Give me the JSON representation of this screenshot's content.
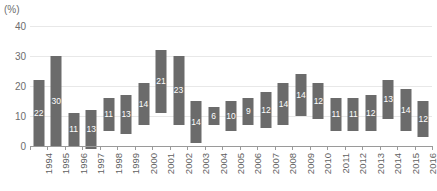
{
  "chart_data": {
    "type": "bar",
    "title": "",
    "subtitle": "",
    "xlabel": "",
    "ylabel": "(%)",
    "unit_label": "(%)",
    "ylim": [
      0,
      40
    ],
    "yticks": [
      0,
      10,
      20,
      30,
      40
    ],
    "ytick_labels": [
      "0",
      "10",
      "20",
      "30",
      "40"
    ],
    "grid": true,
    "legend": "none",
    "orientation": "vertical",
    "bar_style": "floating-range",
    "bar_color": "#6b6b6b",
    "gridline_color": "#e8e8e8",
    "axis_color": "#9a9a9a",
    "label_color": "#5f5f5f",
    "value_label_color": "#ffffff",
    "categories": [
      "1994",
      "1995",
      "1996",
      "1997",
      "1998",
      "1999",
      "2000",
      "2001",
      "2002",
      "2003",
      "2004",
      "2005",
      "2006",
      "2007",
      "2008",
      "2009",
      "2010",
      "2011",
      "2012",
      "2013",
      "2014",
      "2015",
      "2016"
    ],
    "values": [
      22,
      30,
      11,
      13,
      11,
      13,
      14,
      21,
      23,
      14,
      6,
      10,
      9,
      12,
      14,
      14,
      12,
      11,
      11,
      12,
      13,
      14,
      12
    ],
    "bar_ranges": [
      {
        "year": "1994",
        "value": 22,
        "bottom": 0,
        "top": 22
      },
      {
        "year": "1995",
        "value": 30,
        "bottom": 0,
        "top": 30
      },
      {
        "year": "1996",
        "value": 11,
        "bottom": 0,
        "top": 11
      },
      {
        "year": "1997",
        "value": 13,
        "bottom": -1,
        "top": 12
      },
      {
        "year": "1998",
        "value": 11,
        "bottom": 5,
        "top": 16
      },
      {
        "year": "1999",
        "value": 13,
        "bottom": 4,
        "top": 17
      },
      {
        "year": "2000",
        "value": 14,
        "bottom": 7,
        "top": 21
      },
      {
        "year": "2001",
        "value": 21,
        "bottom": 11,
        "top": 32
      },
      {
        "year": "2002",
        "value": 23,
        "bottom": 7,
        "top": 30
      },
      {
        "year": "2003",
        "value": 14,
        "bottom": 1,
        "top": 15
      },
      {
        "year": "2004",
        "value": 6,
        "bottom": 7,
        "top": 13
      },
      {
        "year": "2005",
        "value": 10,
        "bottom": 5,
        "top": 15
      },
      {
        "year": "2006",
        "value": 9,
        "bottom": 7,
        "top": 16
      },
      {
        "year": "2007",
        "value": 12,
        "bottom": 6,
        "top": 18
      },
      {
        "year": "2008",
        "value": 14,
        "bottom": 7,
        "top": 21
      },
      {
        "year": "2009",
        "value": 14,
        "bottom": 10,
        "top": 24
      },
      {
        "year": "2010",
        "value": 12,
        "bottom": 9,
        "top": 21
      },
      {
        "year": "2011",
        "value": 11,
        "bottom": 5,
        "top": 16
      },
      {
        "year": "2012",
        "value": 11,
        "bottom": 5,
        "top": 16
      },
      {
        "year": "2013",
        "value": 12,
        "bottom": 5,
        "top": 17
      },
      {
        "year": "2014",
        "value": 13,
        "bottom": 9,
        "top": 22
      },
      {
        "year": "2015",
        "value": 14,
        "bottom": 5,
        "top": 19
      },
      {
        "year": "2016",
        "value": 12,
        "bottom": 3,
        "top": 15
      }
    ]
  }
}
